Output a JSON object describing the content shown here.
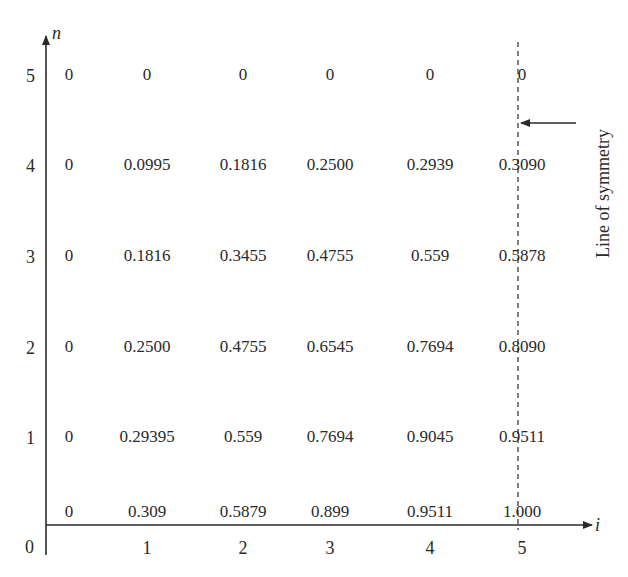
{
  "chart_data": {
    "type": "table",
    "title": "",
    "xlabel": "i",
    "ylabel": "n",
    "x_ticks": [
      "1",
      "2",
      "3",
      "4",
      "5"
    ],
    "y_ticks": [
      "0",
      "1",
      "2",
      "3",
      "4",
      "5"
    ],
    "origin_label": "0",
    "annotation": "Line of symmetry",
    "symmetry_at_i": 5,
    "rows": [
      {
        "n": 5,
        "values": [
          "0",
          "0",
          "0",
          "0",
          "0",
          "0"
        ]
      },
      {
        "n": 4,
        "values": [
          "0",
          "0.0995",
          "0.1816",
          "0.2500",
          "0.2939",
          "0.3090"
        ]
      },
      {
        "n": 3,
        "values": [
          "0",
          "0.1816",
          "0.3455",
          "0.4755",
          "0.559",
          "0.5878"
        ]
      },
      {
        "n": 2,
        "values": [
          "0",
          "0.2500",
          "0.4755",
          "0.6545",
          "0.7694",
          "0.8090"
        ]
      },
      {
        "n": 1,
        "values": [
          "0",
          "0.29395",
          "0.559",
          "0.7694",
          "0.9045",
          "0.9511"
        ]
      },
      {
        "n": 0,
        "values": [
          "0",
          "0.309",
          "0.5879",
          "0.899",
          "0.9511",
          "1.000"
        ]
      }
    ]
  }
}
